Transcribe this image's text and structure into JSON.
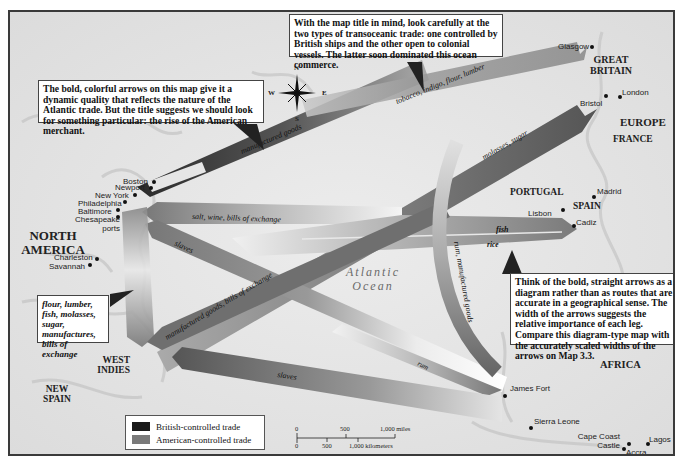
{
  "map": {
    "colors": {
      "british": "#1a1a1a",
      "american": "#7a7a7a",
      "land": "#e6e6e6",
      "frame": "#3a3a3a"
    },
    "callouts": {
      "top_left": "The bold, colorful arrows on this map give it a dynamic quality that reflects the nature of the Atlantic trade. But the title suggests we should look for something particular: the rise of the American merchant.",
      "top_center": "With the map title in mind, look carefully at the two types of transoceanic trade: one controlled by British ships and the other open to colonial vessels. The latter soon dominated this ocean commerce.",
      "right": "Think of the bold, straight arrows as a diagram rather than as routes that are accurate in a geographical sense. The width of the arrows suggests the relative importance of each leg. Compare this diagram-type map with the accurately scaled widths of the arrows on Map 3.3.",
      "west_indies_goods": "flour, lumber, fish, molasses, sugar, manufactures, bills of exchange"
    },
    "regions": {
      "north_america": "North America",
      "west_indies": "West Indies",
      "new_spain": "New Spain",
      "great_britain": "Great Britain",
      "europe": "Europe",
      "france": "France",
      "portugal": "Portugal",
      "spain": "Spain",
      "africa": "Africa",
      "ocean": "Atlantic Ocean"
    },
    "cities": {
      "boston": "Boston",
      "newport": "Newport",
      "new_york": "New York",
      "philadelphia": "Philadelphia",
      "baltimore": "Baltimore",
      "chesapeake": "Chesapeake ports",
      "charleston": "Charleston",
      "savannah": "Savannah",
      "glasgow": "Glasgow",
      "bristol": "Bristol",
      "london": "London",
      "madrid": "Madrid",
      "lisbon": "Lisbon",
      "cadiz": "Cadiz",
      "james_fort": "James Fort",
      "sierra_leone": "Sierra Leone",
      "cape_coast": "Cape Coast Castle",
      "accra": "Accra",
      "lagos": "Lagos"
    },
    "routes": [
      {
        "label": "manufactured goods",
        "from": "Great Britain",
        "to": "North America",
        "control": "british"
      },
      {
        "label": "tobacco, indigo, flour, lumber",
        "from": "North America",
        "to": "Great Britain",
        "control": "american"
      },
      {
        "label": "salt, wine, bills of exchange",
        "from": "Southern Europe",
        "to": "North America",
        "control": "american"
      },
      {
        "label": "fish",
        "from": "North America",
        "to": "Southern Europe",
        "control": "american"
      },
      {
        "label": "rice",
        "from": "North America",
        "to": "Southern Europe",
        "control": "american"
      },
      {
        "label": "slaves",
        "from": "Africa",
        "to": "North America",
        "control": "american"
      },
      {
        "label": "molasses, sugar",
        "from": "West Indies",
        "to": "Great Britain",
        "control": "british"
      },
      {
        "label": "manufactured goods, bills of exchange",
        "from": "Great Britain",
        "to": "West Indies",
        "control": "british"
      },
      {
        "label": "rum, manufactured goods",
        "from": "Great Britain",
        "to": "Africa",
        "control": "british"
      },
      {
        "label": "rum",
        "from": "North America",
        "to": "Africa",
        "control": "american"
      },
      {
        "label": "slaves",
        "from": "Africa",
        "to": "West Indies",
        "control": "british"
      }
    ],
    "compass": {
      "n": "N",
      "s": "S",
      "e": "E",
      "w": "W"
    },
    "legend": {
      "british": "British-controlled trade",
      "american": "American-controlled trade"
    },
    "scale": {
      "miles_ticks": [
        "0",
        "500",
        "1,000 miles"
      ],
      "km_ticks": [
        "0",
        "500",
        "1,000 kilometers"
      ]
    }
  }
}
